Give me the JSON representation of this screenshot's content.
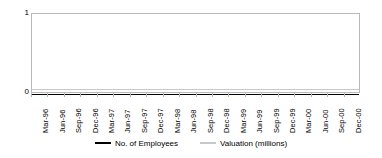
{
  "chart_data": {
    "type": "line",
    "title": "",
    "subtitle": "",
    "xlabel": "",
    "ylabel": "",
    "ylim": [
      0,
      1
    ],
    "y_ticks": [
      "0",
      "1"
    ],
    "grid": false,
    "legend_position": "bottom",
    "categories": [
      "Mar-96",
      "Jun-96",
      "Sep-96",
      "Dec-96",
      "Mar-97",
      "Jun-97",
      "Sep-97",
      "Dec-97",
      "Mar-98",
      "Jun-98",
      "Sep-98",
      "Dec-98",
      "Mar-99",
      "Jun-99",
      "Sep-99",
      "Dec-99",
      "Mar-00",
      "Jun-00",
      "Sep-00",
      "Dec-00"
    ],
    "series": [
      {
        "name": "No. of Employees",
        "color": "#000000",
        "values": [
          0,
          0,
          0,
          0,
          0,
          0,
          0,
          0,
          0,
          0,
          0,
          0,
          0,
          0,
          0,
          0,
          0,
          0,
          0,
          0
        ]
      },
      {
        "name": "Valuation (millions)",
        "color": "#c8c8c8",
        "values": [
          0.06,
          0.06,
          0.06,
          0.06,
          0.06,
          0.06,
          0.06,
          0.06,
          0.06,
          0.06,
          0.06,
          0.06,
          0.06,
          0.06,
          0.06,
          0.06,
          0.06,
          0.06,
          0.06,
          0.06
        ]
      }
    ]
  },
  "axis": {
    "y_max_label": "1",
    "y_min_label": "0"
  },
  "legend": {
    "items": [
      {
        "label": "No. of Employees",
        "color": "#000000"
      },
      {
        "label": "Valuation (millions)",
        "color": "#c8c8c8"
      }
    ]
  },
  "colors": {
    "frame": "#b9b9b9",
    "background": "#ffffff",
    "series_primary": "#000000",
    "series_secondary": "#c8c8c8"
  }
}
